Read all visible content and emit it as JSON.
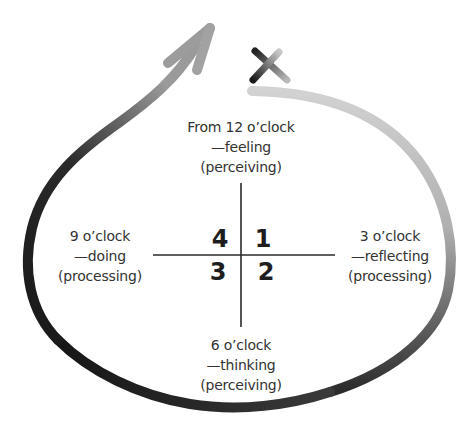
{
  "diagram": {
    "type": "quadrant-cycle",
    "colors": {
      "loop_dark": "#1c1c1c",
      "loop_light": "#c4c4c4",
      "cross_lines": "#2a2a2a",
      "text": "#333333",
      "background": "#ffffff"
    },
    "labels": {
      "top": {
        "line1": "From 12 o’clock",
        "line2": "—feeling",
        "line3": "(perceiving)"
      },
      "right": {
        "line1": "3 o’clock",
        "line2": "—reflecting",
        "line3": "(processing)"
      },
      "bottom": {
        "line1": "6 o’clock",
        "line2": "—thinking",
        "line3": "(perceiving)"
      },
      "left": {
        "line1": "9 o’clock",
        "line2": "—doing",
        "line3": "(processing)"
      }
    },
    "quadrants": {
      "top_right": "1",
      "bottom_right": "2",
      "bottom_left": "3",
      "top_left": "4"
    },
    "markers": {
      "start_mark": "x-mark-icon",
      "end_mark": "arrowhead-icon",
      "direction": "clockwise"
    }
  }
}
